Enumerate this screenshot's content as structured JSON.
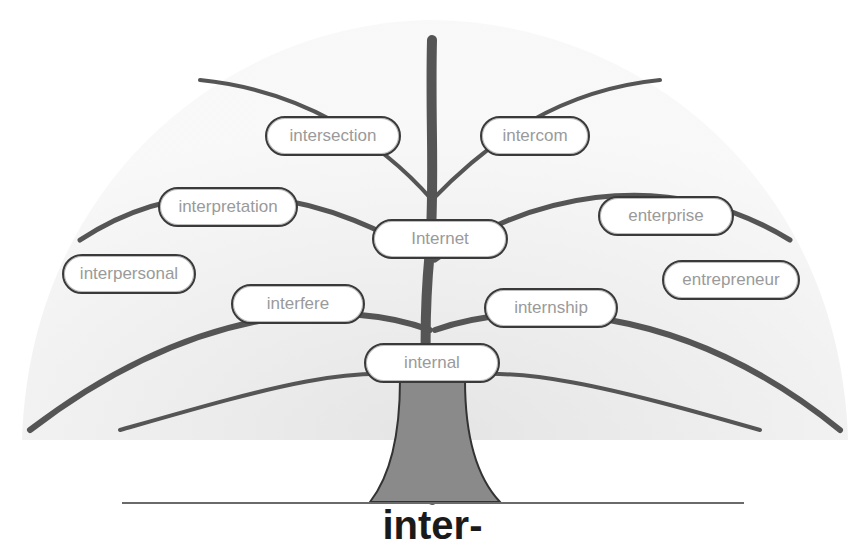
{
  "title": "inter-",
  "labels": [
    {
      "text": "intersection",
      "x": 265,
      "y": 116,
      "w": 136
    },
    {
      "text": "intercom",
      "x": 480,
      "y": 116,
      "w": 110
    },
    {
      "text": "interpretation",
      "x": 158,
      "y": 187,
      "w": 140
    },
    {
      "text": "enterprise",
      "x": 598,
      "y": 196,
      "w": 136
    },
    {
      "text": "Internet",
      "x": 372,
      "y": 219,
      "w": 136
    },
    {
      "text": "interpersonal",
      "x": 62,
      "y": 254,
      "w": 134
    },
    {
      "text": "entrepreneur",
      "x": 662,
      "y": 260,
      "w": 138
    },
    {
      "text": "interfere",
      "x": 231,
      "y": 284,
      "w": 134
    },
    {
      "text": "internship",
      "x": 484,
      "y": 288,
      "w": 134
    },
    {
      "text": "internal",
      "x": 364,
      "y": 343,
      "w": 136
    }
  ]
}
